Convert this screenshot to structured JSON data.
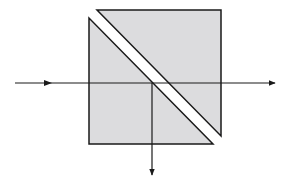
{
  "diagram": {
    "colors": {
      "prism_fill": "#dcdcde",
      "stroke": "#1a1a1a",
      "background": "#ffffff"
    },
    "prisms": [
      {
        "name": "upper-right-prism",
        "points": "97,10 221,10 221,136"
      },
      {
        "name": "lower-left-prism",
        "points": "89,18 89,144 213,144"
      }
    ],
    "beams": {
      "incident": {
        "x1": 15,
        "y1": 83,
        "x2": 152,
        "y2": 83,
        "arrow_x": 50
      },
      "transmitted": {
        "x1": 152,
        "y1": 83,
        "x2": 275,
        "y2": 83
      },
      "reflected": {
        "x1": 152,
        "y1": 83,
        "x2": 152,
        "y2": 175
      }
    }
  }
}
